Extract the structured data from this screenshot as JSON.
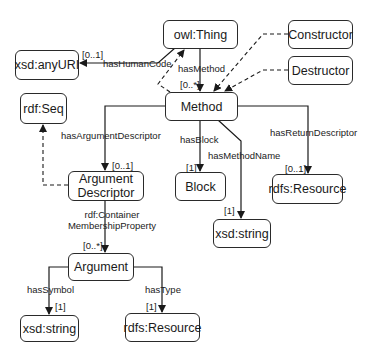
{
  "diagram": {
    "nodes": {
      "owl_thing": "owl:Thing",
      "xsd_anyuri": "xsd:anyURI",
      "constructor": "Constructor",
      "destructor": "Destructor",
      "method": "Method",
      "rdf_seq": "rdf:Seq",
      "argument_descriptor_line1": "Argument",
      "argument_descriptor_line2": "Descriptor",
      "block": "Block",
      "rdfs_resource_return": "rdfs:Resource",
      "xsd_string_name": "xsd:string",
      "argument": "Argument",
      "xsd_string_symbol": "xsd:string",
      "rdfs_resource_type": "rdfs:Resource"
    },
    "edges": {
      "has_human_code": "hasHumanCode",
      "has_human_code_card": "[0..1]",
      "has_method": "hasMethod",
      "has_method_card": "[0..*]",
      "has_argument_descriptor": "hasArgumentDescriptor",
      "has_argument_descriptor_card": "[0..1]",
      "has_block": "hasBlock",
      "has_block_card": "[1]",
      "has_method_name": "hasMethodName",
      "has_method_name_card": "[1]",
      "has_return_descriptor": "hasReturnDescriptor",
      "has_return_descriptor_card": "[0..1]",
      "container_membership_line1": "rdf:Container",
      "container_membership_line2": "MembershipProperty",
      "container_membership_card": "[0..*]",
      "has_symbol": "hasSymbol",
      "has_symbol_card": "[1]",
      "has_type": "hasType",
      "has_type_card": "[1]"
    }
  }
}
